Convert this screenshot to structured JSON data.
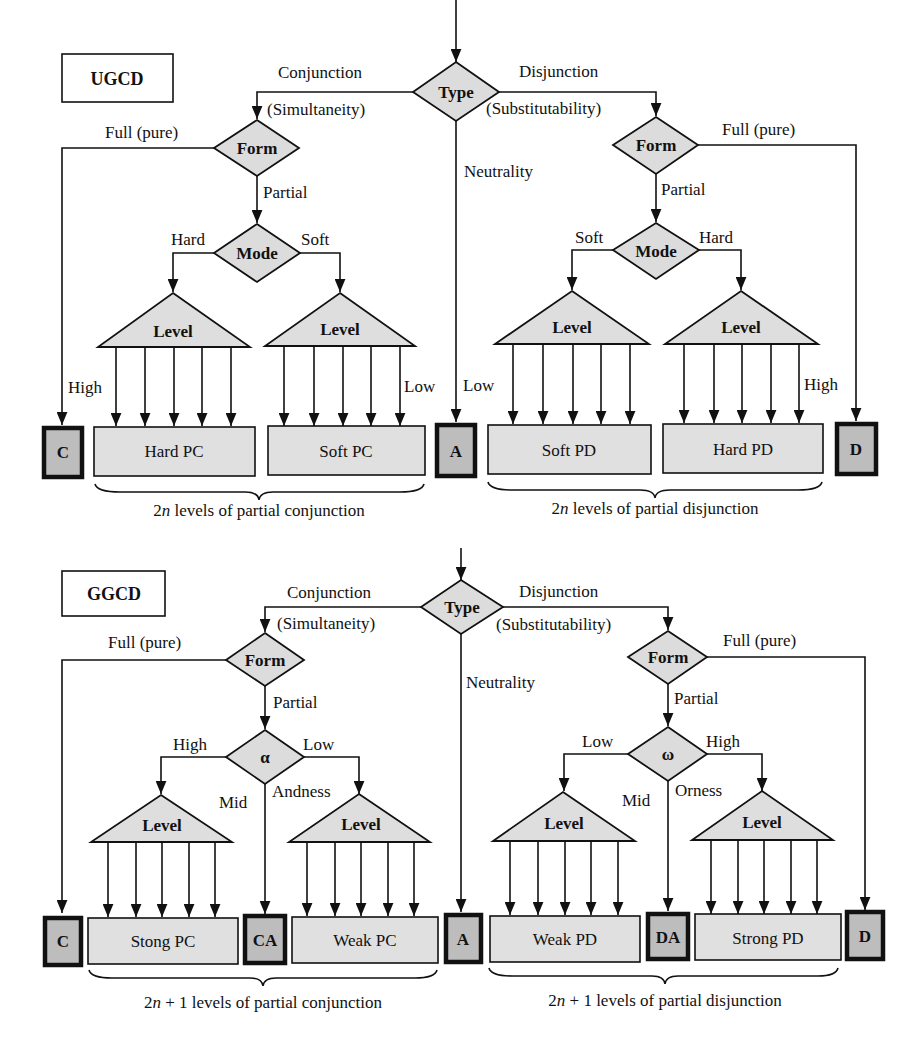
{
  "ugcd": {
    "title": "UGCD",
    "type_node": "Type",
    "conjunction": "Conjunction",
    "simultaneity": "(Simultaneity)",
    "disjunction": "Disjunction",
    "substitutability": "(Substitutability)",
    "neutrality": "Neutrality",
    "left_form": "Form",
    "right_form": "Form",
    "left_full": "Full (pure)",
    "right_full": "Full (pure)",
    "left_partial": "Partial",
    "right_partial": "Partial",
    "left_mode": "Mode",
    "right_mode": "Mode",
    "left_hard": "Hard",
    "left_soft": "Soft",
    "right_soft": "Soft",
    "right_hard": "Hard",
    "level": "Level",
    "high_left": "High",
    "low_left": "Low",
    "low_right": "Low",
    "high_right": "High",
    "terminal_c": "C",
    "terminal_a": "A",
    "terminal_d": "D",
    "hard_pc": "Hard PC",
    "soft_pc": "Soft PC",
    "soft_pd": "Soft PD",
    "hard_pd": "Hard PD",
    "brace_conj_prefix": "2",
    "brace_conj_n": "n",
    "brace_conj_suffix": " levels of partial conjunction",
    "brace_disj_prefix": "2",
    "brace_disj_n": "n",
    "brace_disj_suffix": " levels of partial disjunction"
  },
  "ggcd": {
    "title": "GGCD",
    "type_node": "Type",
    "conjunction": "Conjunction",
    "simultaneity": "(Simultaneity)",
    "disjunction": "Disjunction",
    "substitutability": "(Substitutability)",
    "neutrality": "Neutrality",
    "left_form": "Form",
    "right_form": "Form",
    "left_full": "Full (pure)",
    "right_full": "Full (pure)",
    "left_partial": "Partial",
    "right_partial": "Partial",
    "alpha": "α",
    "omega": "ω",
    "alpha_high": "High",
    "alpha_low": "Low",
    "alpha_mid": "Mid",
    "andness": "Andness",
    "omega_low": "Low",
    "omega_high": "High",
    "omega_mid": "Mid",
    "orness": "Orness",
    "level": "Level",
    "terminal_c": "C",
    "terminal_ca": "CA",
    "terminal_a": "A",
    "terminal_da": "DA",
    "terminal_d": "D",
    "strong_pc": "Stong PC",
    "weak_pc": "Weak PC",
    "weak_pd": "Weak PD",
    "strong_pd": "Strong PD",
    "brace_conj_prefix": "2",
    "brace_conj_n": "n",
    "brace_conj_suffix": " + 1 levels of partial conjunction",
    "brace_disj_prefix": "2",
    "brace_disj_n": "n",
    "brace_disj_suffix": " + 1 levels of partial disjunction"
  }
}
